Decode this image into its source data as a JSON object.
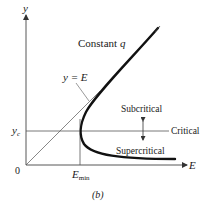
{
  "figure": {
    "caption": "(b)",
    "axes": {
      "y_label": "y",
      "x_label": "E",
      "origin_label": "0",
      "yc_label": "y",
      "yc_sub": "c",
      "emin_label": "E",
      "emin_sub": "min"
    },
    "annotations": {
      "constant_q": "Constant",
      "constant_q_var": "q",
      "y_equals_e": "y = E",
      "subcritical": "Subcritical",
      "critical": "Critical",
      "supercritical": "Supercritical"
    },
    "colors": {
      "curve": "#111111",
      "lines": "#444444",
      "text": "#1a1a1a"
    }
  }
}
